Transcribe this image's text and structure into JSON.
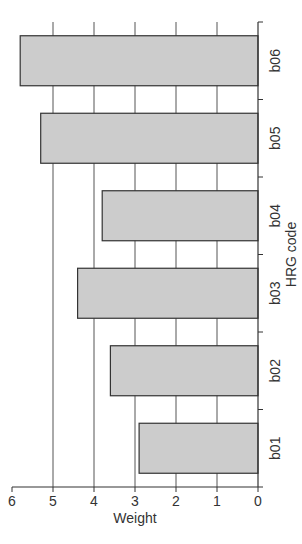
{
  "chart_data": {
    "type": "bar",
    "title": "",
    "xlabel": "HRG code",
    "ylabel": "Weight",
    "categories": [
      "b01",
      "b02",
      "b03",
      "b04",
      "b05",
      "b06"
    ],
    "values": [
      2.9,
      3.6,
      4.4,
      3.8,
      5.3,
      5.8
    ],
    "ylim": [
      0,
      6
    ],
    "yticks": [
      0,
      1,
      2,
      3,
      4,
      5,
      6
    ],
    "grid": "horizontal",
    "legend": null,
    "orientation_note": "figure rotated 90 degrees on page",
    "bar_fill": "#cccccc",
    "bar_edge": "#333333",
    "grid_color": "#555555"
  }
}
